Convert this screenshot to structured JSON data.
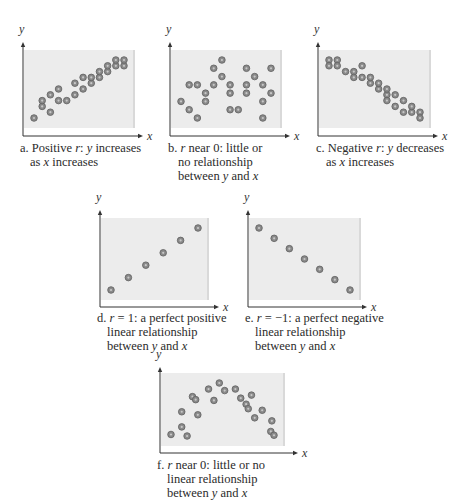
{
  "colors": {
    "plot_bg": "#ececec",
    "plot_bg_edge": "#d9d9d9",
    "axis": "#333333",
    "dot_fill": "#8a8a8a",
    "dot_ring": "#5e5e5e",
    "dot_center": "#c8c8c8"
  },
  "chart_data": [
    {
      "id": "a",
      "type": "scatter",
      "title": "",
      "xlabel": "x",
      "ylabel": "y",
      "caption_line1": "a. Positive r: y increases",
      "caption_line2": "as x increases",
      "grid": false,
      "ticks": "none",
      "points": [
        [
          1,
          2
        ],
        [
          2,
          4
        ],
        [
          2,
          5
        ],
        [
          3,
          6
        ],
        [
          3,
          3
        ],
        [
          4,
          5
        ],
        [
          4,
          7
        ],
        [
          5,
          5
        ],
        [
          6,
          6
        ],
        [
          6,
          8
        ],
        [
          7,
          7
        ],
        [
          8,
          8
        ],
        [
          7,
          9
        ],
        [
          8,
          9
        ],
        [
          9,
          9
        ],
        [
          10,
          10
        ],
        [
          9,
          10
        ],
        [
          10,
          11
        ],
        [
          11,
          11
        ],
        [
          11,
          12
        ],
        [
          12,
          11
        ],
        [
          12,
          12
        ]
      ]
    },
    {
      "id": "b",
      "type": "scatter",
      "title": "",
      "xlabel": "x",
      "ylabel": "y",
      "caption_line1": "b. r near 0: little or",
      "caption_line2": "no relationship",
      "caption_line3": "between y and x",
      "grid": false,
      "ticks": "none",
      "points": [
        [
          1,
          4
        ],
        [
          2,
          6
        ],
        [
          3,
          6
        ],
        [
          4,
          5
        ],
        [
          2,
          3
        ],
        [
          3,
          2
        ],
        [
          4,
          4
        ],
        [
          5,
          8
        ],
        [
          6,
          9
        ],
        [
          6,
          7
        ],
        [
          7,
          6
        ],
        [
          7,
          5
        ],
        [
          8,
          3
        ],
        [
          5,
          6
        ],
        [
          7,
          3
        ],
        [
          9,
          8
        ],
        [
          9,
          5
        ],
        [
          9,
          6
        ],
        [
          10,
          7
        ],
        [
          11,
          4
        ],
        [
          11,
          6
        ],
        [
          11,
          2
        ],
        [
          12,
          5
        ],
        [
          12,
          8
        ]
      ]
    },
    {
      "id": "c",
      "type": "scatter",
      "title": "",
      "xlabel": "x",
      "ylabel": "y",
      "caption_line1": "c. Negative r: y decreases",
      "caption_line2": "as x increases",
      "grid": false,
      "ticks": "none",
      "points": [
        [
          1,
          12
        ],
        [
          1,
          11
        ],
        [
          2,
          12
        ],
        [
          2,
          11
        ],
        [
          3,
          10
        ],
        [
          4,
          10
        ],
        [
          4,
          9
        ],
        [
          5,
          11
        ],
        [
          5,
          9
        ],
        [
          6,
          8
        ],
        [
          6,
          9
        ],
        [
          7,
          7
        ],
        [
          7,
          8
        ],
        [
          8,
          6
        ],
        [
          8,
          7
        ],
        [
          8,
          5
        ],
        [
          9,
          6
        ],
        [
          9,
          4
        ],
        [
          10,
          5
        ],
        [
          10,
          3
        ],
        [
          11,
          3
        ],
        [
          11,
          4
        ],
        [
          12,
          3
        ],
        [
          12,
          2
        ]
      ]
    },
    {
      "id": "d",
      "type": "scatter",
      "title": "",
      "xlabel": "x",
      "ylabel": "y",
      "caption_line1": "d. r = 1: a perfect positive",
      "caption_line2": "linear relationship",
      "caption_line3": "between y and x",
      "grid": false,
      "ticks": "none",
      "points": [
        [
          1,
          1
        ],
        [
          2,
          2
        ],
        [
          3,
          3
        ],
        [
          4,
          4
        ],
        [
          5,
          5
        ],
        [
          6,
          6
        ]
      ]
    },
    {
      "id": "e",
      "type": "scatter",
      "title": "",
      "xlabel": "x",
      "ylabel": "y",
      "caption_line1": "e. r = −1: a perfect negative",
      "caption_line2": "linear relationship",
      "caption_line3": "between y and x",
      "grid": false,
      "ticks": "none",
      "points": [
        [
          1,
          7
        ],
        [
          2,
          6
        ],
        [
          3,
          5
        ],
        [
          4,
          4
        ],
        [
          5,
          3
        ],
        [
          6,
          2
        ],
        [
          7,
          1
        ]
      ]
    },
    {
      "id": "f",
      "type": "scatter",
      "title": "",
      "xlabel": "x",
      "ylabel": "y",
      "caption_line1": "f. r near 0: little or no",
      "caption_line2": "linear relationship",
      "caption_line3": "between y and x",
      "grid": false,
      "ticks": "none",
      "points": [
        [
          1,
          2
        ],
        [
          2,
          3
        ],
        [
          2,
          5
        ],
        [
          2.5,
          1.8
        ],
        [
          3,
          7
        ],
        [
          3.3,
          6.6
        ],
        [
          3.5,
          4.6
        ],
        [
          4.5,
          8
        ],
        [
          5,
          6.5
        ],
        [
          5.5,
          8.8
        ],
        [
          6,
          7.8
        ],
        [
          7,
          8
        ],
        [
          7.5,
          6.8
        ],
        [
          8,
          6
        ],
        [
          8.2,
          5.4
        ],
        [
          8.5,
          7.2
        ],
        [
          8.8,
          4.2
        ],
        [
          9.5,
          5.2
        ],
        [
          10.4,
          3.8
        ],
        [
          10.3,
          2.4
        ],
        [
          10.6,
          1.9
        ]
      ]
    }
  ]
}
